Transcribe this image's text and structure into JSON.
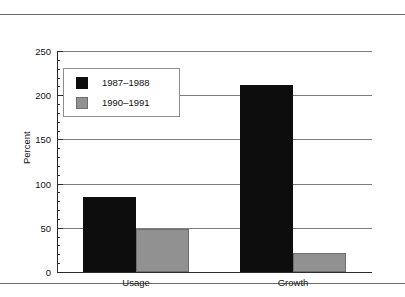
{
  "chart_data": {
    "type": "bar",
    "title": "",
    "xlabel": "",
    "ylabel": "Percent",
    "ylim": [
      0,
      250
    ],
    "ytick_values": [
      0,
      50,
      100,
      150,
      200,
      250
    ],
    "ytick_labels": [
      "0",
      "50",
      "100",
      "150",
      "200",
      "250"
    ],
    "minor_tick_step": 10,
    "grid": true,
    "grid_axis": "y",
    "legend_position": "upper left inside",
    "categories": [
      "Usage",
      "Growth"
    ],
    "series": [
      {
        "name": "1987–1988",
        "color": "#0d0d0d",
        "values": [
          85,
          212
        ]
      },
      {
        "name": "1990–1991",
        "color": "#919191",
        "values": [
          49,
          22
        ]
      }
    ]
  },
  "legend": {
    "entries": [
      {
        "label": "1987–1988",
        "swatch": "legend-swatch-black"
      },
      {
        "label": "1990–1991",
        "swatch": "legend-swatch-gray"
      }
    ]
  },
  "axes": {
    "y_title": "Percent",
    "y_labels": [
      "250",
      "200",
      "150",
      "100",
      "50",
      "0"
    ],
    "x_labels": [
      "Usage",
      "Growth"
    ]
  },
  "colors": {
    "series_1987_1988": "#0d0d0d",
    "series_1990_1991": "#919191",
    "gridline": "#7d7d7d",
    "axis": "#2b2b2b",
    "rule": "#6b6b6b",
    "background": "#ffffff"
  }
}
